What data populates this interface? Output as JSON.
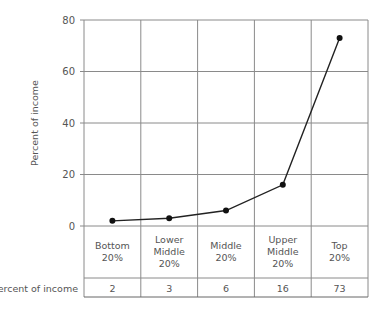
{
  "chart_data": {
    "type": "line",
    "title": "",
    "xlabel": "",
    "ylabel": "Percent of income",
    "ylim": [
      0,
      80
    ],
    "yticks": [
      "0",
      "20",
      "40",
      "60",
      "80"
    ],
    "grid": true,
    "categories": [
      [
        "Bottom",
        "20%"
      ],
      [
        "Lower",
        "Middle",
        "20%"
      ],
      [
        "Middle",
        "20%"
      ],
      [
        "Upper",
        "Middle",
        "20%"
      ],
      [
        "Top",
        "20%"
      ]
    ],
    "values": [
      2,
      3,
      6,
      16,
      73
    ],
    "table": {
      "row_label": "Percent of income",
      "values": [
        "2",
        "3",
        "6",
        "16",
        "73"
      ]
    }
  }
}
